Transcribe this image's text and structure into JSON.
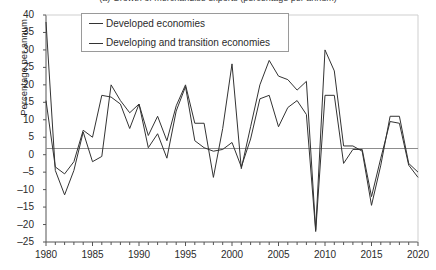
{
  "chart_data": {
    "type": "line",
    "title": "(a) Growth of merchandise exports (percentage per annum)",
    "xlabel": "",
    "ylabel": "Percentage per annum",
    "xlim": [
      1980,
      2020
    ],
    "ylim": [
      -25,
      40
    ],
    "ytick_step": 5,
    "xtick_step": 1,
    "xlabel_step": 5,
    "grid": false,
    "zero_line": true,
    "legend_position": "top-center",
    "x": [
      1980,
      1981,
      1982,
      1983,
      1984,
      1985,
      1986,
      1987,
      1988,
      1989,
      1990,
      1991,
      1992,
      1993,
      1994,
      1995,
      1996,
      1997,
      1998,
      1999,
      2000,
      2001,
      2002,
      2003,
      2004,
      2005,
      2006,
      2007,
      2008,
      2009,
      2010,
      2011,
      2012,
      2013,
      2014,
      2015,
      2016,
      2017,
      2018,
      2019,
      2020
    ],
    "series": [
      {
        "name": "Developed economies",
        "color": "#333333",
        "values": [
          15.5,
          -3.5,
          -5.5,
          -2.0,
          7.0,
          5.0,
          17.0,
          16.5,
          14.5,
          7.5,
          14.5,
          2.0,
          6.0,
          -1.0,
          12.5,
          19.5,
          4.0,
          2.0,
          1.0,
          1.5,
          3.5,
          -3.5,
          4.5,
          16.0,
          17.0,
          8.0,
          13.5,
          15.5,
          11.5,
          -22.0,
          17.0,
          17.0,
          -2.5,
          1.5,
          1.5,
          -12.0,
          -1.0,
          9.5,
          9.0,
          -3.0,
          -6.5
        ]
      },
      {
        "name": "Developing and transition economies",
        "color": "#333333",
        "values": [
          38.0,
          -4.5,
          -11.5,
          -4.5,
          6.5,
          -2.0,
          -0.5,
          20.0,
          15.5,
          12.0,
          14.5,
          5.5,
          11.0,
          4.0,
          14.0,
          20.0,
          9.0,
          9.0,
          -6.5,
          7.5,
          26.0,
          -4.0,
          8.0,
          20.0,
          27.0,
          22.5,
          21.5,
          18.5,
          21.0,
          -21.5,
          30.0,
          24.0,
          2.5,
          2.5,
          1.0,
          -14.5,
          -3.0,
          11.0,
          11.0,
          -2.5,
          -5.0
        ]
      }
    ],
    "ytick_labels": [
      "40",
      "35",
      "30",
      "25",
      "20",
      "15",
      "10",
      "5",
      "0",
      "-5",
      "-10",
      "-15",
      "-20",
      "-25"
    ],
    "xtick_labels": [
      "1980",
      "1985",
      "1990",
      "1995",
      "2000",
      "2005",
      "2010",
      "2015",
      "2020"
    ]
  },
  "legend": {
    "items": [
      {
        "label": "Developed economies"
      },
      {
        "label": "Developing and transition economies"
      }
    ]
  }
}
